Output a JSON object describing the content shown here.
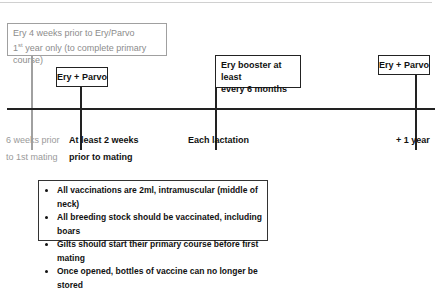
{
  "diagram": {
    "colors": {
      "primary": "#222222",
      "secondary": "#9a9a9a"
    },
    "gilt_box": {
      "line1": "Ery 4 weeks prior to Ery/Parvo",
      "line2_prefix": "1",
      "line2_sup": "st",
      "line2_rest": " year only (to complete primary course)"
    },
    "events": [
      {
        "box": "Ery + Parvo",
        "label_line1": "At least 2 weeks",
        "label_line2": "prior to mating"
      },
      {
        "box_line1": "Ery booster at least",
        "box_line2": "every 6 months",
        "label": "Each lactation"
      },
      {
        "box": "Ery + Parvo",
        "label": "+ 1 year"
      }
    ],
    "gilt_label": {
      "line1": "6 weeks prior",
      "line2": "to 1st mating"
    },
    "notes": [
      "All vaccinations are 2ml, intramuscular (middle of neck)",
      "All breeding stock should be vaccinated, including boars",
      "Gilts should start their primary course before first mating",
      "Once opened, bottles of vaccine can no longer be stored"
    ]
  }
}
